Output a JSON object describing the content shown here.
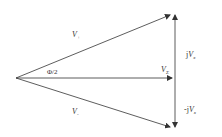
{
  "diagram": {
    "type": "phasor-diagram",
    "colors": {
      "line": "#333333",
      "background": "#ffffff"
    },
    "vectors": [
      {
        "id": "v-plus",
        "label": "V",
        "subscript": "+"
      },
      {
        "id": "v-minus",
        "label": "V",
        "subscript": "-"
      },
      {
        "id": "v-sum",
        "label": "V",
        "subscript": "Σ"
      },
      {
        "id": "jv",
        "label_prefix": "j",
        "label": "V",
        "subscript": "x"
      },
      {
        "id": "neg-jv",
        "label_prefix": "-j",
        "label": "V",
        "subscript": "x"
      }
    ],
    "angle_label": "Φ/2"
  }
}
